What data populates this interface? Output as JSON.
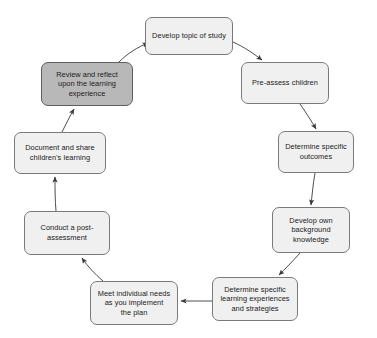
{
  "diagram": {
    "type": "cycle-flowchart",
    "direction": "clockwise",
    "colors": {
      "node_fill": "#f0f0f0",
      "node_fill_highlight": "#b8b8b8",
      "node_border": "#7a7a7a",
      "arrow": "#3a3a3a",
      "background": "#ffffff",
      "text": "#1a1a1a"
    },
    "nodes": [
      {
        "id": "develop-topic",
        "label": "Develop topic of study",
        "highlighted": false,
        "x": 145,
        "y": 17,
        "w": 88,
        "h": 38
      },
      {
        "id": "pre-assess",
        "label": "Pre-assess children",
        "highlighted": false,
        "x": 241,
        "y": 62,
        "w": 88,
        "h": 42
      },
      {
        "id": "determine-outcomes",
        "label": "Determine specific\noutcomes",
        "highlighted": false,
        "x": 278,
        "y": 131,
        "w": 76,
        "h": 42
      },
      {
        "id": "develop-background",
        "label": "Develop own\nbackground\nknowledge",
        "highlighted": false,
        "x": 272,
        "y": 207,
        "w": 78,
        "h": 46
      },
      {
        "id": "determine-experiences",
        "label": "Determine specific\nlearning experiences\nand strategies",
        "highlighted": false,
        "x": 212,
        "y": 277,
        "w": 86,
        "h": 44
      },
      {
        "id": "meet-needs",
        "label": "Meet individual needs\nas you implement\nthe plan",
        "highlighted": false,
        "x": 90,
        "y": 281,
        "w": 88,
        "h": 44
      },
      {
        "id": "post-assessment",
        "label": "Conduct a post-\nassessment",
        "highlighted": false,
        "x": 24,
        "y": 211,
        "w": 86,
        "h": 44
      },
      {
        "id": "document-share",
        "label": "Document and share\nchildren's learning",
        "highlighted": false,
        "x": 14,
        "y": 132,
        "w": 92,
        "h": 42
      },
      {
        "id": "review-reflect",
        "label": "Review and reflect\nupon the learning\nexperience",
        "highlighted": true,
        "x": 41,
        "y": 62,
        "w": 92,
        "h": 44
      }
    ],
    "edges": [
      {
        "from": "develop-topic",
        "to": "pre-assess"
      },
      {
        "from": "pre-assess",
        "to": "determine-outcomes"
      },
      {
        "from": "determine-outcomes",
        "to": "develop-background"
      },
      {
        "from": "develop-background",
        "to": "determine-experiences"
      },
      {
        "from": "determine-experiences",
        "to": "meet-needs"
      },
      {
        "from": "meet-needs",
        "to": "post-assessment"
      },
      {
        "from": "post-assessment",
        "to": "document-share"
      },
      {
        "from": "document-share",
        "to": "review-reflect"
      },
      {
        "from": "review-reflect",
        "to": "develop-topic"
      }
    ]
  }
}
